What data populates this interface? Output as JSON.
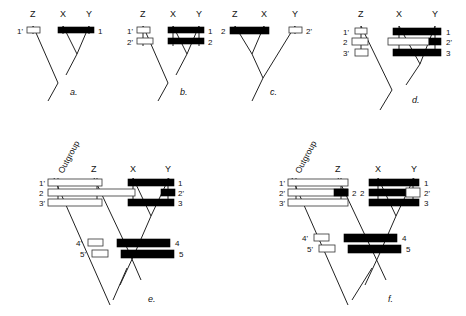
{
  "figure": {
    "colors": {
      "derived_marker": "#000000",
      "ancestral_marker": "#ffffff",
      "line": "#222222",
      "background": "#ffffff"
    },
    "legend_note": "Filled bars denote derived (apomorphic) states; open bars denote ancestral (plesiomorphic) states."
  },
  "panels": [
    {
      "id": "a",
      "label": "a.",
      "taxa": [
        "Z",
        "X",
        "Y"
      ],
      "left_row_labels": [
        "1'"
      ],
      "right_row_labels": [
        "1"
      ],
      "markers": [
        {
          "row": 1,
          "group": "left",
          "taxa": [
            "Z"
          ],
          "state": "open",
          "label": "1'"
        },
        {
          "row": 1,
          "group": "right",
          "taxa": [
            "X",
            "Y"
          ],
          "state": "filled",
          "label": "1"
        }
      ]
    },
    {
      "id": "b",
      "label": "b.",
      "taxa": [
        "Z",
        "X",
        "Y"
      ],
      "left_row_labels": [
        "1'",
        "2'"
      ],
      "right_row_labels": [
        "1",
        "2"
      ],
      "markers": [
        {
          "row": 1,
          "group": "left",
          "taxa": [
            "Z"
          ],
          "state": "open",
          "label": "1'"
        },
        {
          "row": 1,
          "group": "right",
          "taxa": [
            "X",
            "Y"
          ],
          "state": "filled",
          "label": "1"
        },
        {
          "row": 2,
          "group": "left",
          "taxa": [
            "Z"
          ],
          "state": "open",
          "label": "2'"
        },
        {
          "row": 2,
          "group": "right",
          "taxa": [
            "X",
            "Y"
          ],
          "state": "filled",
          "label": "2"
        }
      ]
    },
    {
      "id": "c",
      "label": "c.",
      "taxa": [
        "Z",
        "X",
        "Y"
      ],
      "left_row_labels": [
        "2"
      ],
      "right_row_labels": [
        "2'"
      ],
      "markers": [
        {
          "row": 1,
          "group": "left",
          "taxa": [
            "Z",
            "X"
          ],
          "state": "filled",
          "label": "2"
        },
        {
          "row": 1,
          "group": "right",
          "taxa": [
            "Y"
          ],
          "state": "open",
          "label": "2'"
        }
      ]
    },
    {
      "id": "d",
      "label": "d.",
      "taxa": [
        "Z",
        "X",
        "Y"
      ],
      "left_row_labels": [
        "1'",
        "2",
        "3'"
      ],
      "right_row_labels": [
        "1",
        "2'",
        "3"
      ],
      "markers": [
        {
          "row": 1,
          "group": "left",
          "taxa": [
            "Z"
          ],
          "state": "open",
          "label": "1'"
        },
        {
          "row": 1,
          "group": "right",
          "taxa": [
            "X",
            "Y"
          ],
          "state": "filled",
          "label": "1"
        },
        {
          "row": 2,
          "group": "left",
          "taxa": [
            "Z"
          ],
          "state": "open",
          "label": "2"
        },
        {
          "row": 2,
          "group": "right",
          "taxa": [
            "X"
          ],
          "state": "open",
          "label": ""
        },
        {
          "row": 2,
          "group": "right",
          "taxa": [
            "Y"
          ],
          "state": "filled",
          "label": "2'"
        },
        {
          "row": 3,
          "group": "left",
          "taxa": [
            "Z"
          ],
          "state": "open",
          "label": "3'"
        },
        {
          "row": 3,
          "group": "right",
          "taxa": [
            "X",
            "Y"
          ],
          "state": "filled",
          "label": "3"
        }
      ]
    },
    {
      "id": "e",
      "label": "e.",
      "taxa": [
        "Outgroup",
        "Z",
        "X",
        "Y"
      ],
      "left_row_labels": [
        "1'",
        "2",
        "3'",
        "4'",
        "5'"
      ],
      "right_row_labels": [
        "1",
        "2'",
        "3",
        "4",
        "5"
      ],
      "markers": [
        {
          "row": 1,
          "group": "left",
          "taxa": [
            "Outgroup",
            "Z"
          ],
          "state": "open",
          "label": "1'"
        },
        {
          "row": 1,
          "group": "right",
          "taxa": [
            "X",
            "Y"
          ],
          "state": "filled",
          "label": "1"
        },
        {
          "row": 2,
          "group": "left",
          "taxa": [
            "Outgroup",
            "Z",
            "X"
          ],
          "state": "open",
          "label": "2"
        },
        {
          "row": 2,
          "group": "right",
          "taxa": [
            "Y"
          ],
          "state": "filled",
          "label": "2'"
        },
        {
          "row": 3,
          "group": "left",
          "taxa": [
            "Outgroup",
            "Z"
          ],
          "state": "open",
          "label": "3'"
        },
        {
          "row": 3,
          "group": "right",
          "taxa": [
            "X",
            "Y"
          ],
          "state": "filled",
          "label": "3"
        },
        {
          "row": 4,
          "group": "left",
          "taxa": [
            "Outgroup"
          ],
          "state": "open",
          "label": "4'"
        },
        {
          "row": 4,
          "group": "right",
          "taxa": [
            "Z",
            "X",
            "Y"
          ],
          "state": "filled",
          "label": "4"
        },
        {
          "row": 5,
          "group": "left",
          "taxa": [
            "Outgroup"
          ],
          "state": "open",
          "label": "5'"
        },
        {
          "row": 5,
          "group": "right",
          "taxa": [
            "Z",
            "X",
            "Y"
          ],
          "state": "filled",
          "label": "5"
        }
      ]
    },
    {
      "id": "f",
      "label": "f.",
      "taxa": [
        "Outgroup",
        "Z",
        "X",
        "Y"
      ],
      "left_row_labels": [
        "1'",
        "2'",
        "3'",
        "4'",
        "5'"
      ],
      "right_row_labels": [
        "1",
        "2'",
        "3",
        "4",
        "5"
      ],
      "inner_labels": [
        "2",
        "2"
      ],
      "markers": [
        {
          "row": 1,
          "group": "left",
          "taxa": [
            "Outgroup",
            "Z"
          ],
          "state": "open",
          "label": "1'"
        },
        {
          "row": 1,
          "group": "right",
          "taxa": [
            "X",
            "Y"
          ],
          "state": "filled",
          "label": "1"
        },
        {
          "row": 2,
          "group": "left",
          "taxa": [
            "Outgroup"
          ],
          "state": "open",
          "label": "2'"
        },
        {
          "row": 2,
          "group": "left",
          "taxa": [
            "Z"
          ],
          "state": "filled",
          "label": "2"
        },
        {
          "row": 2,
          "group": "right",
          "taxa": [
            "X"
          ],
          "state": "filled",
          "label": "2"
        },
        {
          "row": 2,
          "group": "right",
          "taxa": [
            "Y"
          ],
          "state": "open",
          "label": "2'"
        },
        {
          "row": 3,
          "group": "left",
          "taxa": [
            "Outgroup",
            "Z"
          ],
          "state": "open",
          "label": "3'"
        },
        {
          "row": 3,
          "group": "right",
          "taxa": [
            "X",
            "Y"
          ],
          "state": "filled",
          "label": "3"
        },
        {
          "row": 4,
          "group": "left",
          "taxa": [
            "Outgroup"
          ],
          "state": "open",
          "label": "4'"
        },
        {
          "row": 4,
          "group": "right",
          "taxa": [
            "Z",
            "X",
            "Y"
          ],
          "state": "filled",
          "label": "4"
        },
        {
          "row": 5,
          "group": "left",
          "taxa": [
            "Outgroup"
          ],
          "state": "open",
          "label": "5'"
        },
        {
          "row": 5,
          "group": "right",
          "taxa": [
            "Z",
            "X",
            "Y"
          ],
          "state": "filled",
          "label": "5"
        }
      ]
    }
  ],
  "text": {
    "taxon_z": "Z",
    "taxon_x": "X",
    "taxon_y": "Y",
    "outgroup": "Outgroup",
    "panel_a": "a.",
    "panel_b": "b.",
    "panel_c": "c.",
    "panel_d": "d.",
    "panel_e": "e.",
    "panel_f": "f.",
    "n1": "1",
    "n1p": "1'",
    "n2": "2",
    "n2p": "2'",
    "n3": "3",
    "n3p": "3'",
    "n4": "4",
    "n4p": "4'",
    "n5": "5",
    "n5p": "5'"
  }
}
